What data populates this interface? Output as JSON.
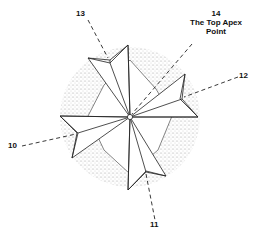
{
  "diagram": {
    "labels": [
      {
        "id": "label-10",
        "text": "10"
      },
      {
        "id": "label-11",
        "text": "11"
      },
      {
        "id": "label-12",
        "text": "12"
      },
      {
        "id": "label-13",
        "text": "13"
      },
      {
        "id": "label-14",
        "number": "14",
        "line1": "The Top Apex",
        "line2": "Point"
      }
    ],
    "colors": {
      "stroke": "#222222",
      "stipple": "#c8c8c8",
      "background": "#ffffff"
    }
  }
}
